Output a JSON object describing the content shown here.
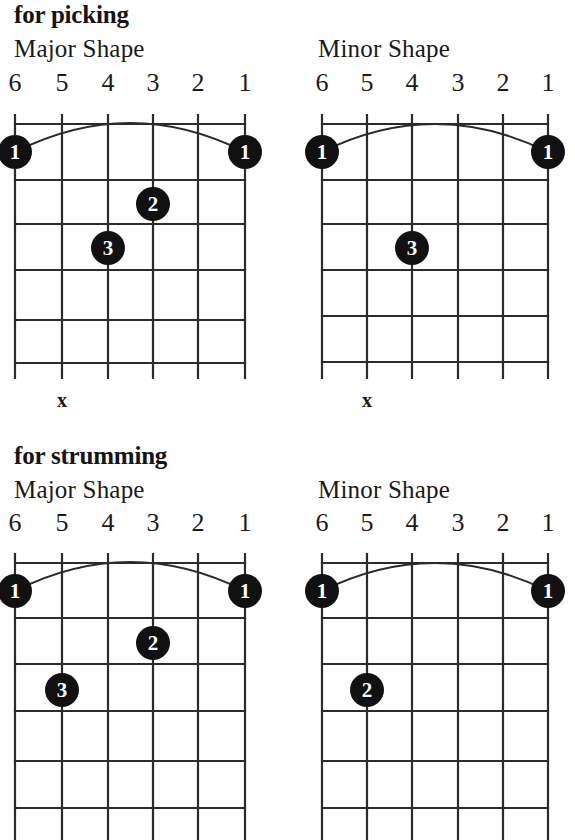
{
  "document": {
    "title": "Barre Chord Shapes",
    "ink_color": "#111111",
    "grid_color": "#2b2b2b",
    "background": "#ffffff"
  },
  "sections": [
    {
      "id": "picking",
      "heading": "for picking",
      "diagrams": [
        {
          "id": "picking-major",
          "title": "Major Shape",
          "string_labels": [
            "6",
            "5",
            "4",
            "3",
            "2",
            "1"
          ],
          "frets": 5,
          "barre": {
            "finger": "1",
            "from_string": 6,
            "to_string": 1,
            "fret": 1
          },
          "dots": [
            {
              "label": "1",
              "string": 6,
              "fret": 1
            },
            {
              "label": "1",
              "string": 1,
              "fret": 1
            },
            {
              "label": "2",
              "string": 3,
              "fret": 2
            },
            {
              "label": "3",
              "string": 4,
              "fret": 3
            }
          ],
          "mutes": [
            {
              "label": "x",
              "string": 5
            }
          ]
        },
        {
          "id": "picking-minor",
          "title": "Minor Shape",
          "string_labels": [
            "6",
            "5",
            "4",
            "3",
            "2",
            "1"
          ],
          "frets": 5,
          "barre": {
            "finger": "1",
            "from_string": 6,
            "to_string": 1,
            "fret": 1
          },
          "dots": [
            {
              "label": "1",
              "string": 6,
              "fret": 1
            },
            {
              "label": "1",
              "string": 1,
              "fret": 1
            },
            {
              "label": "3",
              "string": 4,
              "fret": 3
            }
          ],
          "mutes": [
            {
              "label": "x",
              "string": 5
            }
          ]
        }
      ]
    },
    {
      "id": "strumming",
      "heading": "for strumming",
      "diagrams": [
        {
          "id": "strumming-major",
          "title": "Major Shape",
          "string_labels": [
            "6",
            "5",
            "4",
            "3",
            "2",
            "1"
          ],
          "frets": 5,
          "barre": {
            "finger": "1",
            "from_string": 6,
            "to_string": 1,
            "fret": 1
          },
          "dots": [
            {
              "label": "1",
              "string": 6,
              "fret": 1
            },
            {
              "label": "1",
              "string": 1,
              "fret": 1
            },
            {
              "label": "2",
              "string": 3,
              "fret": 2
            },
            {
              "label": "3",
              "string": 5,
              "fret": 3
            }
          ],
          "mutes": []
        },
        {
          "id": "strumming-minor",
          "title": "Minor Shape",
          "string_labels": [
            "6",
            "5",
            "4",
            "3",
            "2",
            "1"
          ],
          "frets": 5,
          "barre": {
            "finger": "1",
            "from_string": 6,
            "to_string": 1,
            "fret": 1
          },
          "dots": [
            {
              "label": "1",
              "string": 6,
              "fret": 1
            },
            {
              "label": "1",
              "string": 1,
              "fret": 1
            },
            {
              "label": "2",
              "string": 5,
              "fret": 3
            }
          ],
          "mutes": []
        }
      ]
    }
  ]
}
